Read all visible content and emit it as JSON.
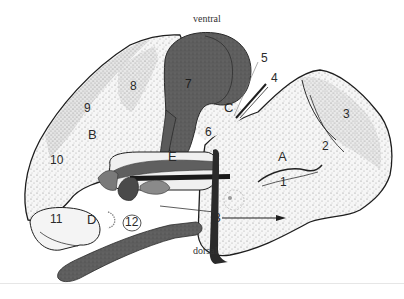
{
  "figure": {
    "orientation": {
      "top": "ventral",
      "bottom": "dorsal"
    },
    "region_labels": [
      {
        "id": "A",
        "text": "A",
        "x": 280,
        "y": 150
      },
      {
        "id": "B",
        "text": "B",
        "x": 89,
        "y": 132
      },
      {
        "id": "C",
        "text": "C",
        "x": 225,
        "y": 102
      },
      {
        "id": "D",
        "text": "D",
        "x": 88,
        "y": 218
      },
      {
        "id": "E",
        "text": "E",
        "x": 170,
        "y": 150
      }
    ],
    "structure_labels": [
      {
        "id": "1",
        "text": "1",
        "x": 281,
        "y": 177
      },
      {
        "id": "2",
        "text": "2",
        "x": 322,
        "y": 142
      },
      {
        "id": "3a",
        "text": "3",
        "x": 342,
        "y": 110
      },
      {
        "id": "3b",
        "text": "3",
        "x": 215,
        "y": 214
      },
      {
        "id": "4",
        "text": "4",
        "x": 270,
        "y": 74
      },
      {
        "id": "5",
        "text": "5",
        "x": 260,
        "y": 54
      },
      {
        "id": "6",
        "text": "6",
        "x": 206,
        "y": 128
      },
      {
        "id": "7",
        "text": "7",
        "x": 186,
        "y": 80
      },
      {
        "id": "8",
        "text": "8",
        "x": 131,
        "y": 82
      },
      {
        "id": "9",
        "text": "9",
        "x": 84,
        "y": 104
      },
      {
        "id": "10",
        "text": "10",
        "x": 52,
        "y": 156
      },
      {
        "id": "11",
        "text": "11",
        "x": 52,
        "y": 215
      },
      {
        "id": "12",
        "text": "12",
        "x": 126,
        "y": 218
      }
    ],
    "colors": {
      "stipple_light": "#e9e9e9",
      "stipple_mid": "#cfcfcf",
      "outline": "#1e1e1e",
      "dark_structure": "#5a5a5a",
      "mid_structure": "#7a7a7a",
      "darkest": "#222222"
    }
  }
}
